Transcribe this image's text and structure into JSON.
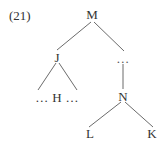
{
  "figure": {
    "example_number": "(21)",
    "background_color": "#ffffff",
    "text_color": "#333333",
    "edge_color": "#6b6b6b",
    "width": 167,
    "height": 145
  },
  "tree": {
    "type": "syntax-tree",
    "nodes": [
      {
        "id": "M",
        "label": "M",
        "x": 92,
        "y": 14,
        "kind": "nonterminal"
      },
      {
        "id": "J",
        "label": "J",
        "x": 57,
        "y": 57,
        "kind": "nonterminal"
      },
      {
        "id": "ELL",
        "label": "…",
        "x": 123,
        "y": 58,
        "kind": "ellipsis"
      },
      {
        "id": "HROW",
        "label": "… H …",
        "x": 57,
        "y": 97,
        "kind": "terminal-row"
      },
      {
        "id": "N",
        "label": "N",
        "x": 123,
        "y": 96,
        "kind": "nonterminal"
      },
      {
        "id": "L",
        "label": "L",
        "x": 90,
        "y": 133,
        "kind": "terminal"
      },
      {
        "id": "K",
        "label": "K",
        "x": 152,
        "y": 133,
        "kind": "terminal"
      }
    ],
    "edges": [
      {
        "id": "M-J",
        "from": "M",
        "to": "J",
        "x1": 91,
        "y1": 22,
        "x2": 57,
        "y2": 50
      },
      {
        "id": "M-ELL",
        "from": "M",
        "to": "ELL",
        "x1": 94,
        "y1": 22,
        "x2": 124,
        "y2": 51
      },
      {
        "id": "J-H1",
        "from": "J",
        "to": "HROW",
        "x1": 56,
        "y1": 63,
        "x2": 38,
        "y2": 90
      },
      {
        "id": "J-H2",
        "from": "J",
        "to": "HROW",
        "x1": 59,
        "y1": 63,
        "x2": 77,
        "y2": 90
      },
      {
        "id": "ELL-N",
        "from": "ELL",
        "to": "N",
        "x1": 123,
        "y1": 64,
        "x2": 123,
        "y2": 89
      },
      {
        "id": "N-L",
        "from": "N",
        "to": "L",
        "x1": 121,
        "y1": 102,
        "x2": 89,
        "y2": 127
      },
      {
        "id": "N-K",
        "from": "N",
        "to": "K",
        "x1": 125,
        "y1": 102,
        "x2": 153,
        "y2": 127
      }
    ]
  }
}
